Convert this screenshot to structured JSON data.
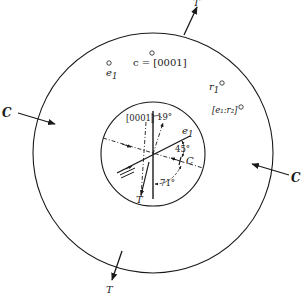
{
  "figure": {
    "type": "stereographic projection diagram (mineral twinning / slip geometry)",
    "outer_circle": {
      "markers": [
        {
          "id": "e1_outer",
          "label": "e",
          "subscript": "1"
        },
        {
          "id": "c_axis",
          "label": "c = [0001]"
        },
        {
          "id": "r1",
          "label": "r",
          "subscript": "1"
        },
        {
          "id": "e1_r2",
          "label": "[e₁:r₂]"
        }
      ],
      "arrows": [
        {
          "id": "tension_top",
          "label": "T",
          "direction": "outward"
        },
        {
          "id": "tension_bottom",
          "label": "T",
          "direction": "outward"
        },
        {
          "id": "compression_left",
          "label": "C",
          "direction": "inward"
        },
        {
          "id": "compression_right",
          "label": "C",
          "direction": "inward"
        }
      ]
    },
    "inner_circle": {
      "labels": {
        "axis": "[0001]",
        "angle_top": "19°",
        "plane": "e",
        "plane_sub": "1",
        "angle_plane_c": "45°",
        "compression": "C",
        "tension": "T",
        "angle_bottom": "71°"
      }
    }
  }
}
